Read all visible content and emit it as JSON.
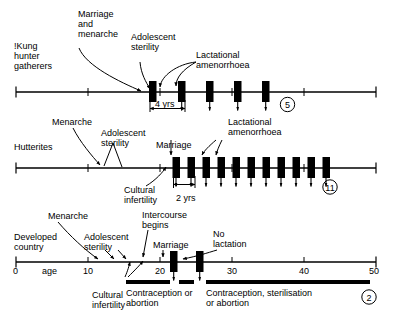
{
  "figure": {
    "title_implicit": "Reproductive life-span timelines for three populations",
    "age_axis": {
      "label": "age",
      "ticks": [
        0,
        10,
        20,
        30,
        40,
        50
      ],
      "tick_labels": [
        "0",
        "10",
        "20",
        "30",
        "40",
        "50"
      ],
      "min": 0,
      "max": 50
    }
  },
  "panels": [
    {
      "id": "kung",
      "population_label": "!Kung\nhunter\ngatherers",
      "births_count_label": "5",
      "span_label": "4 yrs",
      "annotations": [
        {
          "name": "marriage-and-menarche",
          "text": "Marriage\nand\nmenarche"
        },
        {
          "name": "adolescent-sterility",
          "text": "Adolescent\nsterility"
        },
        {
          "name": "lactational-amenorrhoea",
          "text": "Lactational\namenorrhoea"
        }
      ],
      "pregnancy_ages": [
        18.6,
        22.6,
        26.5,
        30.4,
        34.4
      ],
      "birth_arrow_ages": [
        22.6,
        26.5,
        30.4,
        34.4
      ],
      "axis_start_age": 0,
      "axis_end_age": 50
    },
    {
      "id": "hutterites",
      "population_label": "Hutterites",
      "births_count_label": "11",
      "span_label": "2 yrs",
      "annotations": [
        {
          "name": "menarche",
          "text": "Menarche"
        },
        {
          "name": "adolescent-sterility",
          "text": "Adolescent\nsterility"
        },
        {
          "name": "cultural-infertility",
          "text": "Cultural\ninfertility"
        },
        {
          "name": "marriage",
          "text": "Marriage"
        },
        {
          "name": "lactational-amenorrhoea",
          "text": "Lactational\namenorrhoea"
        }
      ],
      "pregnancy_ages": [
        20.6,
        22.6,
        24.6,
        26.6,
        28.6,
        30.6,
        32.6,
        34.6,
        36.6,
        38.6,
        40.6
      ],
      "birth_arrow_ages": [
        21.5,
        23.5,
        25.5,
        27.5,
        29.5,
        31.5,
        33.5,
        35.5,
        37.5,
        39.5,
        41.5
      ],
      "axis_start_age": 0,
      "axis_end_age": 50
    },
    {
      "id": "developed",
      "population_label": "Developed\ncountry",
      "births_count_label": "2",
      "annotations": [
        {
          "name": "menarche",
          "text": "Menarche"
        },
        {
          "name": "adolescent-sterility",
          "text": "Adolescent\nsterility"
        },
        {
          "name": "cultural-infertility",
          "text": "Cultural\ninfertility"
        },
        {
          "name": "intercourse-begins",
          "text": "Intercourse\nbegins"
        },
        {
          "name": "marriage",
          "text": "Marriage"
        },
        {
          "name": "no-lactation",
          "text": "No\nlactation"
        }
      ],
      "pregnancy_ages": [
        24.4,
        28.0
      ],
      "birth_arrow_ages": [
        25.0,
        28.6
      ],
      "control_bars": [
        {
          "name": "contraception-or-abortion",
          "text": "Contraception or\nabortion",
          "start_age": 17.5,
          "end_age": 23.6
        },
        {
          "name": "contraception-gap",
          "text": "",
          "start_age": 25.4,
          "end_age": 27.4
        },
        {
          "name": "contraception-sterilisation-or-abortion",
          "text": "Contraception, sterilisation\nor abortion",
          "start_age": 29.2,
          "end_age": 50
        }
      ],
      "axis_start_age": 0,
      "axis_end_age": 50
    }
  ],
  "colors": {
    "ink": "#000000",
    "paper": "#ffffff"
  }
}
